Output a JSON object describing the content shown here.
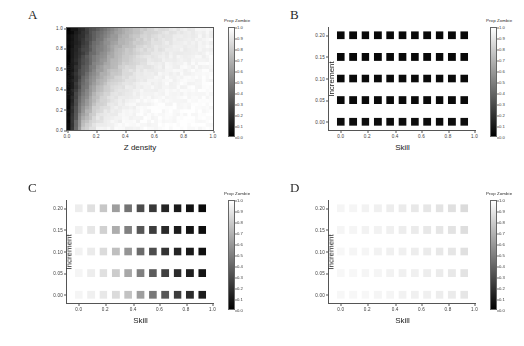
{
  "figure": {
    "background": "#ffffff",
    "colorbar_title": "Prop Zombie",
    "colorbar_ticks": [
      "1.0",
      "0.9",
      "0.8",
      "0.7",
      "0.6",
      "0.5",
      "0.4",
      "0.3",
      "0.2",
      "0.1",
      "0.0"
    ],
    "colorbar_high_color": "#ffffff",
    "colorbar_low_color": "#000000"
  },
  "panels": [
    {
      "id": "a",
      "letter": "A",
      "xlabel": "Z density",
      "ylabel": "H density",
      "xticks": [
        "0.0",
        "0.2",
        "0.4",
        "0.6",
        "0.8",
        "1.0"
      ],
      "yticks": [
        "1.0",
        "0.8",
        "0.6",
        "0.4",
        "0.2",
        "0.0"
      ]
    },
    {
      "id": "b",
      "letter": "B",
      "xlabel": "Skill",
      "ylabel": "Increment",
      "xticks": [
        "0.0",
        "0.2",
        "0.4",
        "0.6",
        "0.8",
        "1.0"
      ],
      "yticks": [
        "0.20",
        "0.15",
        "0.10",
        "0.05",
        "0.00"
      ]
    },
    {
      "id": "c",
      "letter": "C",
      "xlabel": "Skill",
      "ylabel": "Increment",
      "xticks": [
        "0.0",
        "0.2",
        "0.4",
        "0.6",
        "0.8",
        "1.0"
      ],
      "yticks": [
        "0.20",
        "0.15",
        "0.10",
        "0.05",
        "0.00"
      ]
    },
    {
      "id": "d",
      "letter": "D",
      "xlabel": "Skill",
      "ylabel": "Increment",
      "xticks": [
        "0.0",
        "0.2",
        "0.4",
        "0.6",
        "0.8",
        "1.0"
      ],
      "yticks": [
        "0.20",
        "0.15",
        "0.10",
        "0.05",
        "0.00"
      ]
    }
  ],
  "chart_data": [
    {
      "type": "heatmap",
      "panel": "A",
      "title": "",
      "xlabel": "Z density",
      "ylabel": "H density",
      "xlim": [
        0.0,
        1.0
      ],
      "ylim": [
        0.0,
        1.0
      ],
      "xticks": [
        0.0,
        0.2,
        0.4,
        0.6,
        0.8,
        1.0
      ],
      "yticks": [
        0.0,
        0.2,
        0.4,
        0.6,
        0.8,
        1.0
      ],
      "colorbar_label": "Prop Zombie",
      "zlim": [
        0.0,
        1.0
      ],
      "grid": false,
      "legend_position": "right",
      "render": "continuous-grid",
      "ncols": 40,
      "nrows": 30,
      "note": "Continuous fine-grained raster. Prop Zombie is near 0 (black) at very low Z density and rises toward 1 (white) as Z density increases; for a given Z density the value is lower (darker) at higher H density. Boundary is a diagonal-ish front from lower-left to upper-right.",
      "x": [
        0.0,
        0.1,
        0.2,
        0.3,
        0.4,
        0.5,
        0.6,
        0.7,
        0.8,
        0.9,
        1.0
      ],
      "y": [
        1.0,
        0.8,
        0.6,
        0.4,
        0.2,
        0.0
      ],
      "values": [
        [
          0.02,
          0.18,
          0.38,
          0.55,
          0.68,
          0.78,
          0.85,
          0.89,
          0.92,
          0.94,
          0.95
        ],
        [
          0.02,
          0.24,
          0.47,
          0.64,
          0.76,
          0.84,
          0.89,
          0.92,
          0.94,
          0.95,
          0.96
        ],
        [
          0.03,
          0.32,
          0.58,
          0.74,
          0.84,
          0.9,
          0.93,
          0.95,
          0.96,
          0.97,
          0.97
        ],
        [
          0.03,
          0.43,
          0.71,
          0.85,
          0.91,
          0.94,
          0.96,
          0.97,
          0.97,
          0.98,
          0.98
        ],
        [
          0.04,
          0.58,
          0.84,
          0.92,
          0.95,
          0.97,
          0.98,
          0.98,
          0.98,
          0.99,
          0.99
        ],
        [
          0.05,
          0.78,
          0.93,
          0.96,
          0.97,
          0.98,
          0.98,
          0.99,
          0.99,
          0.99,
          0.99
        ]
      ]
    },
    {
      "type": "heatmap",
      "panel": "B",
      "title": "",
      "xlabel": "Skill",
      "ylabel": "Increment",
      "xlim": [
        0.0,
        1.0
      ],
      "ylim": [
        0.0,
        0.2
      ],
      "xticks": [
        0.0,
        0.2,
        0.4,
        0.6,
        0.8,
        1.0
      ],
      "yticks": [
        0.0,
        0.05,
        0.1,
        0.15,
        0.2
      ],
      "colorbar_label": "Prop Zombie",
      "zlim": [
        0.0,
        1.0
      ],
      "grid": false,
      "legend_position": "right",
      "render": "square-markers",
      "note": "5 rows x 11 columns of large dark squares; Prop Zombie is uniformly near 0 (black) across all Skill and Increment combinations.",
      "x": [
        0.0,
        0.1,
        0.2,
        0.3,
        0.4,
        0.5,
        0.6,
        0.7,
        0.8,
        0.9,
        1.0
      ],
      "y": [
        0.2,
        0.15,
        0.1,
        0.05,
        0.0
      ],
      "values": [
        [
          0.03,
          0.03,
          0.03,
          0.03,
          0.03,
          0.03,
          0.03,
          0.03,
          0.03,
          0.03,
          0.03
        ],
        [
          0.03,
          0.03,
          0.03,
          0.03,
          0.03,
          0.03,
          0.03,
          0.03,
          0.03,
          0.03,
          0.03
        ],
        [
          0.04,
          0.04,
          0.04,
          0.04,
          0.04,
          0.04,
          0.04,
          0.04,
          0.04,
          0.04,
          0.04
        ],
        [
          0.04,
          0.04,
          0.04,
          0.04,
          0.04,
          0.04,
          0.04,
          0.04,
          0.04,
          0.04,
          0.04
        ],
        [
          0.05,
          0.05,
          0.05,
          0.05,
          0.05,
          0.05,
          0.05,
          0.05,
          0.05,
          0.05,
          0.05
        ]
      ]
    },
    {
      "type": "heatmap",
      "panel": "C",
      "title": "",
      "xlabel": "Skill",
      "ylabel": "Increment",
      "xlim": [
        0.0,
        1.0
      ],
      "ylim": [
        0.0,
        0.2
      ],
      "xticks": [
        0.0,
        0.2,
        0.4,
        0.6,
        0.8,
        1.0
      ],
      "yticks": [
        0.0,
        0.05,
        0.1,
        0.15,
        0.2
      ],
      "colorbar_label": "Prop Zombie",
      "zlim": [
        0.0,
        1.0
      ],
      "grid": false,
      "legend_position": "right",
      "render": "square-markers",
      "note": "5 rows x 11 columns of squares forming a left-to-right gradient: near-white (Prop Zombie ~0.95) at Skill 0.0 falling to near-black (~0.05) at Skill 1.0. Higher Increment rows darken slightly sooner than lower Increment rows.",
      "x": [
        0.0,
        0.1,
        0.2,
        0.3,
        0.4,
        0.5,
        0.6,
        0.7,
        0.8,
        0.9,
        1.0
      ],
      "y": [
        0.2,
        0.15,
        0.1,
        0.05,
        0.0
      ],
      "values": [
        [
          0.93,
          0.88,
          0.78,
          0.62,
          0.45,
          0.3,
          0.22,
          0.14,
          0.1,
          0.07,
          0.04
        ],
        [
          0.94,
          0.9,
          0.82,
          0.68,
          0.5,
          0.34,
          0.24,
          0.16,
          0.11,
          0.08,
          0.05
        ],
        [
          0.95,
          0.92,
          0.86,
          0.75,
          0.58,
          0.42,
          0.3,
          0.2,
          0.14,
          0.1,
          0.06
        ],
        [
          0.96,
          0.93,
          0.88,
          0.8,
          0.66,
          0.5,
          0.36,
          0.25,
          0.17,
          0.12,
          0.08
        ],
        [
          0.96,
          0.94,
          0.91,
          0.86,
          0.76,
          0.62,
          0.47,
          0.34,
          0.24,
          0.17,
          0.11
        ]
      ]
    },
    {
      "type": "heatmap",
      "panel": "D",
      "title": "",
      "xlabel": "Skill",
      "ylabel": "Increment",
      "xlim": [
        0.0,
        1.0
      ],
      "ylim": [
        0.0,
        0.2
      ],
      "xticks": [
        0.0,
        0.2,
        0.4,
        0.6,
        0.8,
        1.0
      ],
      "yticks": [
        0.0,
        0.05,
        0.1,
        0.15,
        0.2
      ],
      "colorbar_label": "Prop Zombie",
      "zlim": [
        0.0,
        1.0
      ],
      "grid": false,
      "legend_position": "right",
      "render": "square-markers",
      "note": "5 rows x 11 columns of very light squares; Prop Zombie stays high (~0.85-0.97) everywhere, shading only slightly darker toward high Skill.",
      "x": [
        0.0,
        0.1,
        0.2,
        0.3,
        0.4,
        0.5,
        0.6,
        0.7,
        0.8,
        0.9,
        1.0
      ],
      "y": [
        0.2,
        0.15,
        0.1,
        0.05,
        0.0
      ],
      "values": [
        [
          0.96,
          0.96,
          0.95,
          0.94,
          0.93,
          0.92,
          0.91,
          0.9,
          0.89,
          0.88,
          0.86
        ],
        [
          0.96,
          0.96,
          0.95,
          0.95,
          0.94,
          0.93,
          0.92,
          0.91,
          0.9,
          0.89,
          0.87
        ],
        [
          0.97,
          0.96,
          0.96,
          0.95,
          0.94,
          0.94,
          0.93,
          0.92,
          0.91,
          0.9,
          0.88
        ],
        [
          0.97,
          0.97,
          0.96,
          0.96,
          0.95,
          0.94,
          0.94,
          0.93,
          0.92,
          0.91,
          0.89
        ],
        [
          0.97,
          0.97,
          0.97,
          0.96,
          0.96,
          0.95,
          0.94,
          0.94,
          0.93,
          0.92,
          0.9
        ]
      ]
    }
  ]
}
